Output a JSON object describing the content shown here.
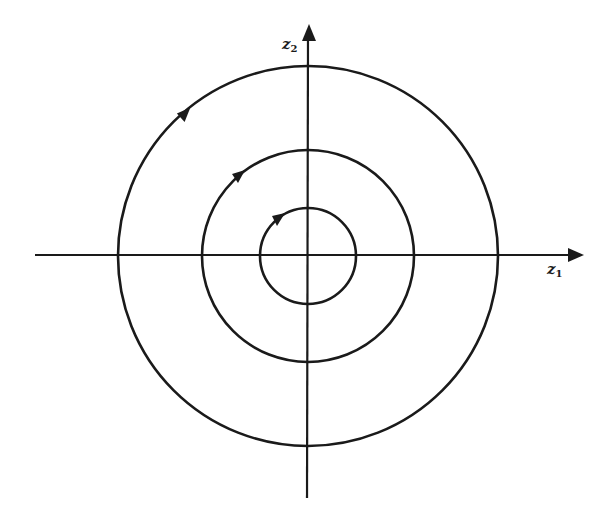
{
  "diagram": {
    "type": "phase-portrait",
    "axes": {
      "horizontal": {
        "label_base": "z",
        "label_sub": "1"
      },
      "vertical": {
        "label_base": "z",
        "label_sub": "2"
      }
    },
    "origin": {
      "x": 308,
      "y": 256
    },
    "orbits": [
      {
        "name": "inner",
        "radius": 48,
        "direction": "clockwise"
      },
      {
        "name": "middle",
        "radius": 106,
        "direction": "clockwise"
      },
      {
        "name": "outer",
        "radius": 190,
        "direction": "clockwise"
      }
    ],
    "colors": {
      "stroke": "#1a1a1a",
      "background": "#ffffff"
    }
  }
}
